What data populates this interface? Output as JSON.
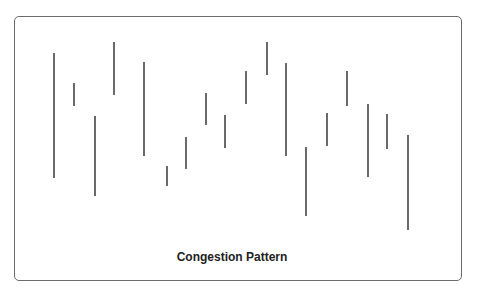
{
  "chart_data": {
    "type": "bar",
    "subtype": "high-low range bars",
    "title": "Congestion Pattern",
    "xlabel": "",
    "ylabel": "",
    "grid": false,
    "legend": null,
    "axes_visible": false,
    "note": "Values are pixel-space high/low (y down) for 18 price-range bars",
    "bars": [
      {
        "x": 54,
        "high": 53,
        "low": 178
      },
      {
        "x": 74,
        "high": 83,
        "low": 106
      },
      {
        "x": 95,
        "high": 116,
        "low": 196
      },
      {
        "x": 114,
        "high": 42,
        "low": 95
      },
      {
        "x": 144,
        "high": 62,
        "low": 156
      },
      {
        "x": 167,
        "high": 166,
        "low": 186
      },
      {
        "x": 186,
        "high": 137,
        "low": 169
      },
      {
        "x": 206,
        "high": 93,
        "low": 125
      },
      {
        "x": 225,
        "high": 115,
        "low": 148
      },
      {
        "x": 246,
        "high": 71,
        "low": 104
      },
      {
        "x": 267,
        "high": 42,
        "low": 75
      },
      {
        "x": 286,
        "high": 63,
        "low": 156
      },
      {
        "x": 306,
        "high": 147,
        "low": 216
      },
      {
        "x": 327,
        "high": 113,
        "low": 146
      },
      {
        "x": 347,
        "high": 71,
        "low": 106
      },
      {
        "x": 368,
        "high": 104,
        "low": 177
      },
      {
        "x": 387,
        "high": 114,
        "low": 149
      },
      {
        "x": 408,
        "high": 135,
        "low": 230
      }
    ]
  },
  "colors": {
    "bar": "#2a2a2a",
    "frame": "#6a6a6a",
    "background": "#ffffff"
  }
}
